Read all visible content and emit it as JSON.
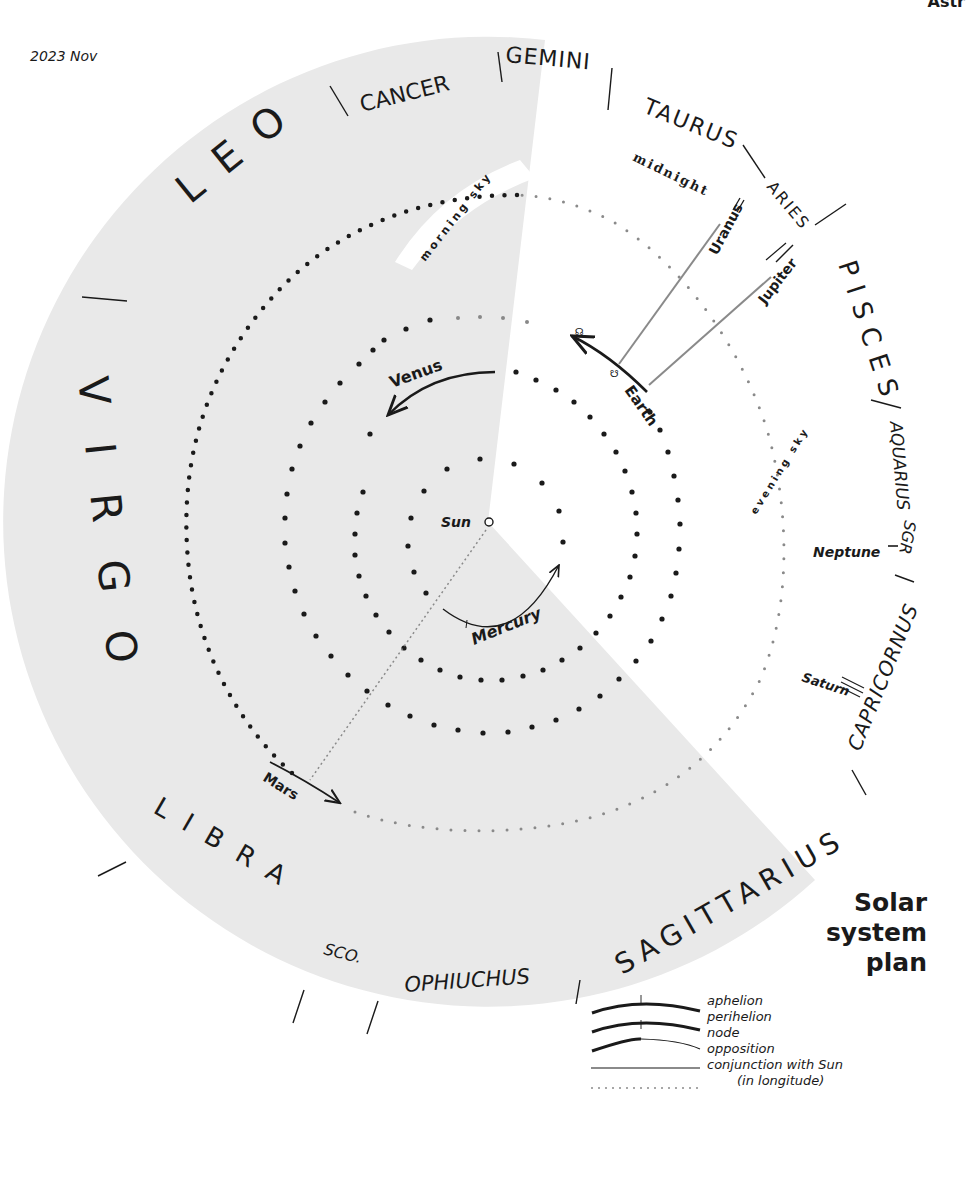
{
  "header": {
    "date": "2023 Nov",
    "top_right_cut_text": "Astr"
  },
  "title": {
    "line1": "Solar",
    "line2": "system",
    "line3": "plan"
  },
  "constellations": [
    {
      "name": "LEO",
      "angle": -40
    },
    {
      "name": "CANCER",
      "angle": -10
    },
    {
      "name": "GEMINI",
      "angle": 8
    },
    {
      "name": "TAURUS",
      "angle": 28
    },
    {
      "name": "ARIES",
      "angle": 45
    },
    {
      "name": "PISCES",
      "angle": 68
    },
    {
      "name": "AQUARIUS",
      "angle": 92
    },
    {
      "name": "SGR/CAPRICORNUS",
      "angle": 115
    },
    {
      "name": "SAGITTARIUS",
      "angle": 140
    },
    {
      "name": "OPHIUCHUS",
      "angle": 177
    },
    {
      "name": "SCO.",
      "angle": 196
    },
    {
      "name": "LIBRA",
      "angle": 215
    },
    {
      "name": "VIRGO",
      "angle": 262
    }
  ],
  "constellation_labels": {
    "leo": "LEO",
    "cancer": "CANCER",
    "gemini": "GEMINI",
    "taurus": "TAURUS",
    "aries": "ARIES",
    "pisces": "PISCES",
    "aquarius": "AQUARIUS",
    "capricornus": "CAPRICORNUS",
    "sgr": "SGR",
    "sagittarius": "SAGITTARIUS",
    "ophiuchus": "OPHIUCHUS",
    "sco": "SCO.",
    "libra": "LIBRA",
    "virgo": "VIRGO"
  },
  "bodies": {
    "sun": "Sun",
    "mercury": "Mercury",
    "venus": "Venus",
    "earth": "Earth",
    "mars": "Mars",
    "jupiter": "Jupiter",
    "saturn": "Saturn",
    "uranus": "Uranus",
    "neptune": "Neptune"
  },
  "sky_regions": {
    "morning": "morning sky",
    "evening": "evening sky",
    "midnight": "midnight"
  },
  "legend": [
    {
      "label": "aphelion",
      "style": "thick-arc-tick-up"
    },
    {
      "label": "perihelion",
      "style": "thick-arc-tick-down"
    },
    {
      "label": "node",
      "style": "thick-to-thin-arc"
    },
    {
      "label": "opposition",
      "style": "gray-line"
    },
    {
      "label": "conjunction with Sun",
      "sublabel": "(in longitude)",
      "style": "dotted-line"
    }
  ],
  "colors": {
    "shade": "#e9e9e9",
    "ink": "#1a1a1a",
    "opposition_line": "#8a8a8a",
    "dotted": "#8a8a8a"
  }
}
